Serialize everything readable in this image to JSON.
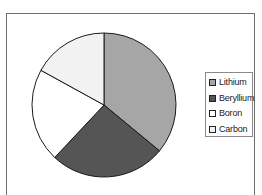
{
  "chart_data": {
    "type": "pie",
    "title": "",
    "categories": [
      "Lithium",
      "Beryllium",
      "Boron",
      "Carbon"
    ],
    "values": [
      36,
      26,
      21,
      17
    ],
    "colors": [
      "#a6a6a6",
      "#555555",
      "#ffffff",
      "#f2f2f2"
    ],
    "start_angle_deg": 0,
    "direction": "clockwise",
    "legend_position": "right",
    "show_data_labels": false
  },
  "legend": {
    "items": [
      {
        "label": "Lithium",
        "color": "#a6a6a6"
      },
      {
        "label": "Beryllium",
        "color": "#555555"
      },
      {
        "label": "Boron",
        "color": "#ffffff"
      },
      {
        "label": "Carbon",
        "color": "#f2f2f2"
      }
    ]
  }
}
